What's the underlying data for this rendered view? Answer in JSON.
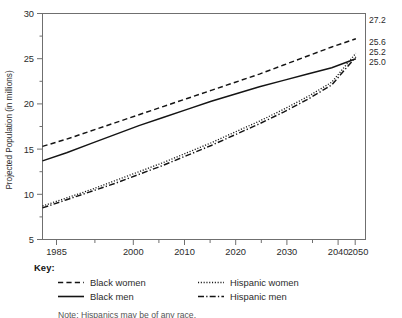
{
  "chart_data": {
    "type": "line",
    "title": "",
    "xlabel": "",
    "ylabel": "Projected Population (in millions)",
    "xlim": [
      1985,
      2052
    ],
    "ylim": [
      5,
      30
    ],
    "xticks": [
      1985,
      2000,
      2010,
      2020,
      2030,
      2040,
      2050
    ],
    "xtick_labels": [
      "1985",
      "2000",
      "2010",
      "2020",
      "2030",
      "2040",
      "2050"
    ],
    "x_minor_ticks": [
      1990,
      1995,
      2005,
      2015,
      2025,
      2035,
      2045
    ],
    "yticks": [
      5,
      10,
      15,
      20,
      25,
      30
    ],
    "ytick_labels": [
      "5",
      "10",
      "15",
      "20",
      "25",
      "30"
    ],
    "y_minor_ticks": [
      7.5,
      12.5,
      17.5,
      22.5,
      27.5
    ],
    "grid": false,
    "legend_position": "below-plot",
    "x": [
      1985,
      1990,
      1995,
      2000,
      2005,
      2010,
      2015,
      2020,
      2025,
      2030,
      2035,
      2040,
      2045,
      2050
    ],
    "series": [
      {
        "name": "Black women",
        "style": "dashed",
        "end_label": "27.2",
        "values": [
          15.3,
          16.1,
          17.0,
          17.9,
          18.8,
          19.7,
          20.6,
          21.5,
          22.4,
          23.3,
          24.3,
          25.3,
          26.3,
          27.2
        ]
      },
      {
        "name": "Black men",
        "style": "solid",
        "end_label": "25.0",
        "values": [
          13.7,
          14.6,
          15.6,
          16.6,
          17.6,
          18.5,
          19.4,
          20.3,
          21.1,
          21.9,
          22.6,
          23.3,
          24.0,
          25.0
        ]
      },
      {
        "name": "Hispanic women",
        "style": "dotted",
        "end_label": "25.6",
        "values": [
          8.7,
          9.6,
          10.5,
          11.5,
          12.5,
          13.5,
          14.6,
          15.7,
          16.9,
          18.1,
          19.4,
          20.8,
          22.4,
          25.6
        ]
      },
      {
        "name": "Hispanic men",
        "style": "dash-dot",
        "end_label": "25.2",
        "values": [
          8.5,
          9.4,
          10.3,
          11.2,
          12.2,
          13.2,
          14.3,
          15.4,
          16.6,
          17.8,
          19.1,
          20.5,
          22.1,
          25.2
        ]
      }
    ],
    "end_labels": [
      "27.2",
      "25.6",
      "25.2",
      "25.0"
    ],
    "colors": {
      "line": "#141414",
      "axis": "#6f6f6f",
      "text": "#2b2b2b"
    }
  },
  "legend": {
    "title": "Key:",
    "entries": [
      {
        "label": "Black women",
        "swatch": "dashed-line-icon"
      },
      {
        "label": "Hispanic women",
        "swatch": "dotted-line-icon"
      },
      {
        "label": "Black men",
        "swatch": "solid-line-icon"
      },
      {
        "label": "Hispanic men",
        "swatch": "dash-dot-line-icon"
      }
    ]
  },
  "footnote": "Note: Hispanics may be of any race."
}
